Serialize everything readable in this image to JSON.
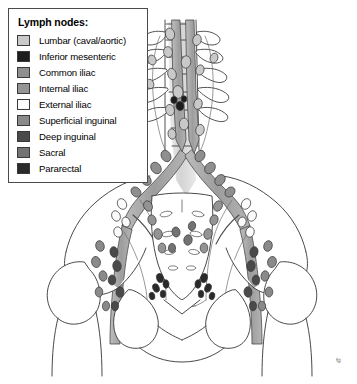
{
  "figure": {
    "name": "pelvic-lymph-node-anatomy",
    "background_color": "#ffffff",
    "signature": "fg"
  },
  "legend": {
    "title": "Lymph nodes:",
    "items": [
      {
        "label": "Lumbar (caval/aortic)",
        "color": "#c9c9c9",
        "swatch_name": "swatch-lumbar"
      },
      {
        "label": "Inferior mesenteric",
        "color": "#1d1d1d",
        "swatch_name": "swatch-inferior-mesenteric"
      },
      {
        "label": "Common iliac",
        "color": "#8f8f8f",
        "swatch_name": "swatch-common-iliac"
      },
      {
        "label": "Internal iliac",
        "color": "#949494",
        "swatch_name": "swatch-internal-iliac"
      },
      {
        "label": "External iliac",
        "color": "#fbfbfb",
        "swatch_name": "swatch-external-iliac"
      },
      {
        "label": "Superficial inguinal",
        "color": "#8a8a8a",
        "swatch_name": "swatch-superficial-inguinal"
      },
      {
        "label": "Deep inguinal",
        "color": "#4a4a4a",
        "swatch_name": "swatch-deep-inguinal"
      },
      {
        "label": "Sacral",
        "color": "#737373",
        "swatch_name": "swatch-sacral"
      },
      {
        "label": "Pararectal",
        "color": "#2a2a2a",
        "swatch_name": "swatch-pararectal"
      }
    ]
  },
  "palette": {
    "outline": "#3f3f3f",
    "bone_fill": "#ffffff",
    "vessel_fill": "#a8a8a8",
    "vessel_light": "#bdbdbd",
    "node_lumbar": "#c9c9c9",
    "node_common_iliac": "#8f8f8f",
    "node_internal_iliac": "#949494",
    "node_external_iliac": "#fbfbfb",
    "node_superficial_inguinal": "#8a8a8a",
    "node_deep_inguinal": "#4a4a4a",
    "node_sacral": "#737373",
    "node_pararectal": "#2a2a2a",
    "node_inferior_mesenteric": "#1d1d1d",
    "spine_shadow": "#d7d7d7"
  },
  "anatomy": {
    "regions": [
      {
        "name": "lumbar-spine",
        "description": "Lumbar vertebral column with transverse processes"
      },
      {
        "name": "aorta-vena-cava",
        "description": "Great vessels descending anterior to spine"
      },
      {
        "name": "sacrum",
        "description": "Sacrum with paired sacral foramina"
      },
      {
        "name": "iliac-bone-left",
        "description": "Left ilium and iliac crest"
      },
      {
        "name": "iliac-bone-right",
        "description": "Right ilium and iliac crest"
      },
      {
        "name": "femur-head-left",
        "description": "Left femoral head and neck"
      },
      {
        "name": "femur-head-right",
        "description": "Right femoral head and neck"
      },
      {
        "name": "obturator-foramen-left",
        "description": "Left obturator foramen"
      },
      {
        "name": "obturator-foramen-right",
        "description": "Right obturator foramen"
      },
      {
        "name": "pubic-symphysis",
        "description": "Pubic bones and symphysis"
      }
    ]
  }
}
